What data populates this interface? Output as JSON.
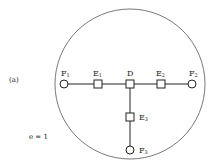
{
  "figure": {
    "panel_label": "(a)",
    "parameter_text": "e = 1"
  },
  "diagram": {
    "boundary": {
      "shape": "circle",
      "cx": 130,
      "cy": 84,
      "r": 75
    },
    "nodes": [
      {
        "id": "F1",
        "label": "F",
        "sub": "1",
        "shape": "circle",
        "x": 64,
        "y": 84
      },
      {
        "id": "E1",
        "label": "E",
        "sub": "1",
        "shape": "square",
        "x": 98,
        "y": 84
      },
      {
        "id": "D",
        "label": "D",
        "sub": "",
        "shape": "square",
        "x": 130,
        "y": 84
      },
      {
        "id": "E2",
        "label": "E",
        "sub": "2",
        "shape": "square",
        "x": 161,
        "y": 84
      },
      {
        "id": "F2",
        "label": "F",
        "sub": "2",
        "shape": "circle",
        "x": 192,
        "y": 84
      },
      {
        "id": "E3",
        "label": "E",
        "sub": "3",
        "shape": "square",
        "x": 130,
        "y": 117
      },
      {
        "id": "F3",
        "label": "F",
        "sub": "3",
        "shape": "circle",
        "x": 130,
        "y": 150
      }
    ],
    "edges": [
      [
        "F1",
        "E1"
      ],
      [
        "E1",
        "D"
      ],
      [
        "D",
        "E2"
      ],
      [
        "E2",
        "F2"
      ],
      [
        "D",
        "E3"
      ],
      [
        "E3",
        "F3"
      ]
    ]
  }
}
